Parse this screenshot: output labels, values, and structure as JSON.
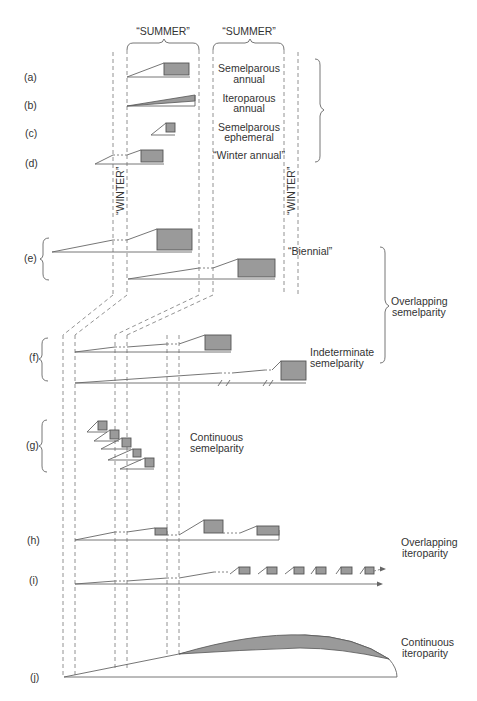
{
  "season_labels": {
    "summer_1": "“SUMMER”",
    "summer_2": "“SUMMER”",
    "winter_1": "“WINTER”",
    "winter_2": "“WINTER”"
  },
  "rows": [
    {
      "id": "a",
      "label": "(a)",
      "description": [
        "Semelparous",
        "annual"
      ]
    },
    {
      "id": "b",
      "label": "(b)",
      "description": [
        "Iteroparous",
        "annual"
      ]
    },
    {
      "id": "c",
      "label": "(c)",
      "description": [
        "Semelparous",
        "ephemeral"
      ]
    },
    {
      "id": "d",
      "label": "(d)",
      "description": [
        "“Winter annual”"
      ]
    },
    {
      "id": "e",
      "label": "(e)",
      "description": [
        "“Biennial”"
      ]
    },
    {
      "id": "f",
      "label": "(f)",
      "description": [
        "Indeterminate",
        "semelparity"
      ]
    },
    {
      "id": "g",
      "label": "(g)",
      "description": [
        "Continuous",
        "semelparity"
      ]
    },
    {
      "id": "h",
      "label": "(h)",
      "description": []
    },
    {
      "id": "i",
      "label": "(i)",
      "description": []
    },
    {
      "id": "j",
      "label": "(j)",
      "description": []
    }
  ],
  "group_labels": {
    "overlapping_semelparity": [
      "Overlapping",
      "semelparity"
    ],
    "overlapping_iteroparity": [
      "Overlapping",
      "iteroparity"
    ],
    "continuous_iteroparity": [
      "Continuous",
      "iteroparity"
    ]
  },
  "colors": {
    "reproduction_fill": "#9a9a9a",
    "line": "#666666",
    "background": "#ffffff"
  }
}
